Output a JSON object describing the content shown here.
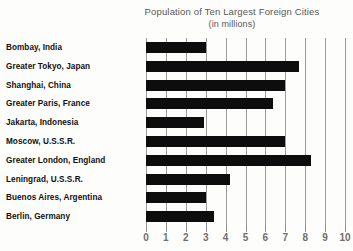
{
  "chart_data": {
    "type": "bar",
    "orientation": "horizontal",
    "title": "Population of Ten Largest Foreign Cities",
    "subtitle": "(in millions)",
    "xlabel": "",
    "ylabel": "",
    "xlim": [
      0,
      10
    ],
    "xticks": [
      "0",
      "1",
      "2",
      "3",
      "4",
      "5",
      "6",
      "7",
      "8",
      "9",
      "10"
    ],
    "grid": "vertical",
    "legend": "none",
    "bar_color": "#0d0d0d",
    "categories": [
      "Bombay, India",
      "Greater Tokyo, Japan",
      "Shanghai, China",
      "Greater Paris, France",
      "Jakarta, Indonesia",
      "Moscow, U.S.S.R.",
      "Greater London, England",
      "Leningrad, U.S.S.R.",
      "Buenos Aires, Argentina",
      "Berlin, Germany"
    ],
    "values": [
      3.0,
      7.7,
      7.0,
      6.4,
      2.9,
      7.0,
      8.3,
      4.2,
      3.0,
      3.4
    ]
  }
}
